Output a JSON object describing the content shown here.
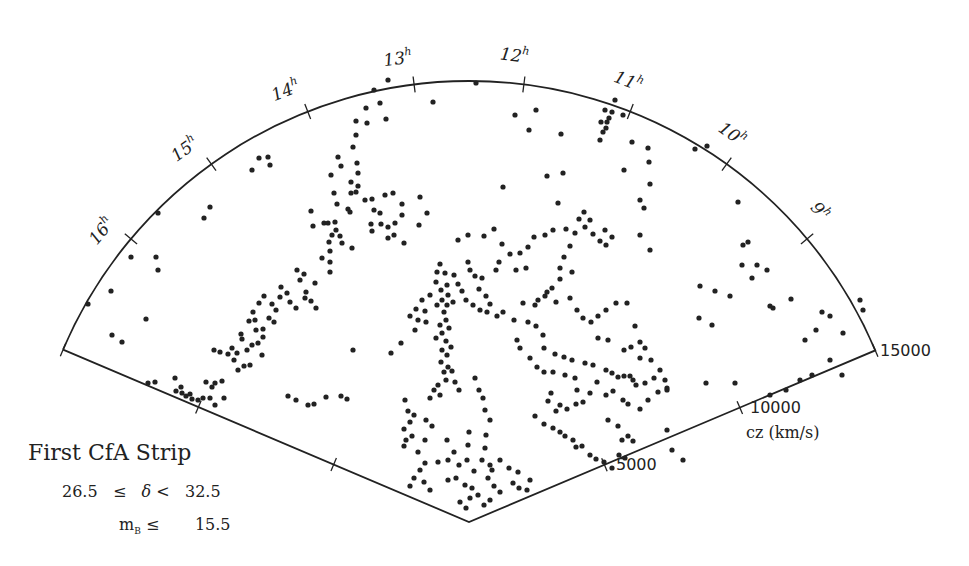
{
  "chart_data": {
    "type": "scatter",
    "projection": "polar-wedge",
    "title": "First CfA Strip",
    "subtitle_dec": "26.5  ≤  δ <  32.5",
    "subtitle_mag": "m_B ≤     15.5",
    "radial_axis": {
      "label": "cz (km/s)",
      "range": [
        0,
        15000
      ],
      "ticks": [
        5000,
        10000,
        15000
      ]
    },
    "angular_axis": {
      "label": "Right Ascension (h)",
      "range": [
        8.0,
        17.4
      ],
      "ticks": [
        "9h",
        "10h",
        "11h",
        "12h",
        "13h",
        "14h",
        "15h",
        "16h"
      ]
    },
    "points_pixel_note": "points given as [x, y] in 969x566 canvas pixels",
    "points": [
      [
        476,
        83
      ],
      [
        433,
        102
      ],
      [
        388,
        80
      ],
      [
        374,
        90
      ],
      [
        366,
        108
      ],
      [
        367,
        123
      ],
      [
        356,
        121
      ],
      [
        356,
        135
      ],
      [
        353,
        147
      ],
      [
        386,
        119
      ],
      [
        380,
        103
      ],
      [
        259,
        158
      ],
      [
        268,
        157
      ],
      [
        252,
        170
      ],
      [
        270,
        165
      ],
      [
        210,
        207
      ],
      [
        204,
        218
      ],
      [
        158,
        213
      ],
      [
        131,
        257
      ],
      [
        156,
        257
      ],
      [
        158,
        270
      ],
      [
        111,
        291
      ],
      [
        146,
        319
      ],
      [
        122,
        342
      ],
      [
        112,
        335
      ],
      [
        88,
        304
      ],
      [
        338,
        157
      ],
      [
        341,
        166
      ],
      [
        357,
        163
      ],
      [
        358,
        173
      ],
      [
        331,
        175
      ],
      [
        351,
        182
      ],
      [
        358,
        186
      ],
      [
        356,
        192
      ],
      [
        351,
        193
      ],
      [
        334,
        193
      ],
      [
        337,
        204
      ],
      [
        348,
        209
      ],
      [
        350,
        212
      ],
      [
        365,
        200
      ],
      [
        372,
        199
      ],
      [
        374,
        210
      ],
      [
        380,
        213
      ],
      [
        385,
        195
      ],
      [
        393,
        193
      ],
      [
        402,
        204
      ],
      [
        402,
        215
      ],
      [
        371,
        224
      ],
      [
        381,
        224
      ],
      [
        372,
        231
      ],
      [
        388,
        227
      ],
      [
        395,
        223
      ],
      [
        394,
        235
      ],
      [
        388,
        238
      ],
      [
        404,
        243
      ],
      [
        419,
        225
      ],
      [
        427,
        213
      ],
      [
        420,
        197
      ],
      [
        311,
        211
      ],
      [
        313,
        226
      ],
      [
        324,
        223
      ],
      [
        328,
        223
      ],
      [
        335,
        222
      ],
      [
        336,
        230
      ],
      [
        340,
        236
      ],
      [
        332,
        235
      ],
      [
        329,
        242
      ],
      [
        330,
        251
      ],
      [
        330,
        262
      ],
      [
        330,
        272
      ],
      [
        342,
        243
      ],
      [
        352,
        248
      ],
      [
        322,
        258
      ],
      [
        315,
        283
      ],
      [
        306,
        292
      ],
      [
        305,
        298
      ],
      [
        287,
        293
      ],
      [
        290,
        302
      ],
      [
        296,
        308
      ],
      [
        311,
        301
      ],
      [
        316,
        308
      ],
      [
        297,
        270
      ],
      [
        304,
        274
      ],
      [
        300,
        280
      ],
      [
        281,
        287
      ],
      [
        280,
        297
      ],
      [
        264,
        296
      ],
      [
        259,
        303
      ],
      [
        253,
        312
      ],
      [
        249,
        321
      ],
      [
        255,
        320
      ],
      [
        256,
        330
      ],
      [
        263,
        329
      ],
      [
        263,
        337
      ],
      [
        258,
        343
      ],
      [
        252,
        345
      ],
      [
        241,
        334
      ],
      [
        242,
        339
      ],
      [
        232,
        348
      ],
      [
        220,
        352
      ],
      [
        214,
        350
      ],
      [
        228,
        354
      ],
      [
        237,
        353
      ],
      [
        234,
        360
      ],
      [
        247,
        350
      ],
      [
        272,
        304
      ],
      [
        276,
        310
      ],
      [
        269,
        318
      ],
      [
        274,
        322
      ],
      [
        262,
        355
      ],
      [
        250,
        365
      ],
      [
        238,
        370
      ],
      [
        206,
        382
      ],
      [
        215,
        383
      ],
      [
        222,
        381
      ],
      [
        244,
        366
      ],
      [
        148,
        383
      ],
      [
        155,
        382
      ],
      [
        175,
        378
      ],
      [
        181,
        387
      ],
      [
        176,
        391
      ],
      [
        182,
        393
      ],
      [
        186,
        396
      ],
      [
        190,
        394
      ],
      [
        192,
        399
      ],
      [
        198,
        400
      ],
      [
        203,
        398
      ],
      [
        210,
        398
      ],
      [
        215,
        405
      ],
      [
        224,
        398
      ],
      [
        212,
        387
      ],
      [
        288,
        396
      ],
      [
        296,
        400
      ],
      [
        308,
        405
      ],
      [
        314,
        404
      ],
      [
        326,
        397
      ],
      [
        341,
        396
      ],
      [
        347,
        399
      ],
      [
        353,
        350
      ],
      [
        401,
        343
      ],
      [
        391,
        353
      ],
      [
        440,
        264
      ],
      [
        445,
        273
      ],
      [
        447,
        285
      ],
      [
        441,
        290
      ],
      [
        448,
        295
      ],
      [
        442,
        300
      ],
      [
        437,
        305
      ],
      [
        447,
        305
      ],
      [
        453,
        302
      ],
      [
        444,
        312
      ],
      [
        446,
        320
      ],
      [
        440,
        325
      ],
      [
        449,
        328
      ],
      [
        442,
        333
      ],
      [
        436,
        338
      ],
      [
        446,
        341
      ],
      [
        451,
        347
      ],
      [
        442,
        350
      ],
      [
        447,
        355
      ],
      [
        441,
        362
      ],
      [
        448,
        367
      ],
      [
        444,
        372
      ],
      [
        452,
        371
      ],
      [
        446,
        380
      ],
      [
        438,
        385
      ],
      [
        434,
        390
      ],
      [
        430,
        398
      ],
      [
        440,
        395
      ],
      [
        455,
        382
      ],
      [
        459,
        390
      ],
      [
        437,
        272
      ],
      [
        436,
        282
      ],
      [
        430,
        295
      ],
      [
        422,
        300
      ],
      [
        416,
        309
      ],
      [
        410,
        316
      ],
      [
        418,
        320
      ],
      [
        426,
        322
      ],
      [
        415,
        330
      ],
      [
        425,
        311
      ],
      [
        454,
        275
      ],
      [
        458,
        284
      ],
      [
        462,
        291
      ],
      [
        466,
        300
      ],
      [
        473,
        305
      ],
      [
        480,
        310
      ],
      [
        487,
        312
      ],
      [
        497,
        316
      ],
      [
        503,
        312
      ],
      [
        490,
        304
      ],
      [
        486,
        296
      ],
      [
        479,
        289
      ],
      [
        482,
        278
      ],
      [
        475,
        276
      ],
      [
        470,
        270
      ],
      [
        468,
        262
      ],
      [
        458,
        240
      ],
      [
        468,
        235
      ],
      [
        484,
        236
      ],
      [
        494,
        229
      ],
      [
        502,
        244
      ],
      [
        510,
        254
      ],
      [
        499,
        262
      ],
      [
        496,
        270
      ],
      [
        516,
        270
      ],
      [
        526,
        268
      ],
      [
        520,
        253
      ],
      [
        528,
        247
      ],
      [
        534,
        237
      ],
      [
        545,
        235
      ],
      [
        553,
        230
      ],
      [
        566,
        229
      ],
      [
        575,
        233
      ],
      [
        585,
        227
      ],
      [
        579,
        219
      ],
      [
        584,
        212
      ],
      [
        590,
        220
      ],
      [
        593,
        234
      ],
      [
        600,
        241
      ],
      [
        606,
        245
      ],
      [
        612,
        237
      ],
      [
        605,
        230
      ],
      [
        570,
        246
      ],
      [
        564,
        257
      ],
      [
        560,
        268
      ],
      [
        572,
        272
      ],
      [
        560,
        279
      ],
      [
        552,
        288
      ],
      [
        545,
        296
      ],
      [
        535,
        305
      ],
      [
        523,
        303
      ],
      [
        514,
        320
      ],
      [
        528,
        322
      ],
      [
        536,
        326
      ],
      [
        543,
        335
      ],
      [
        544,
        348
      ],
      [
        555,
        354
      ],
      [
        564,
        357
      ],
      [
        572,
        360
      ],
      [
        585,
        363
      ],
      [
        593,
        365
      ],
      [
        606,
        370
      ],
      [
        612,
        373
      ],
      [
        618,
        377
      ],
      [
        624,
        376
      ],
      [
        633,
        380
      ],
      [
        645,
        383
      ],
      [
        654,
        378
      ],
      [
        667,
        388
      ],
      [
        517,
        340
      ],
      [
        520,
        348
      ],
      [
        530,
        358
      ],
      [
        537,
        367
      ],
      [
        544,
        372
      ],
      [
        553,
        372
      ],
      [
        565,
        375
      ],
      [
        575,
        378
      ],
      [
        577,
        390
      ],
      [
        551,
        393
      ],
      [
        548,
        401
      ],
      [
        556,
        411
      ],
      [
        560,
        405
      ],
      [
        567,
        409
      ],
      [
        576,
        404
      ],
      [
        583,
        402
      ],
      [
        590,
        393
      ],
      [
        597,
        382
      ],
      [
        635,
        326
      ],
      [
        640,
        342
      ],
      [
        645,
        348
      ],
      [
        651,
        360
      ],
      [
        660,
        370
      ],
      [
        665,
        380
      ],
      [
        667,
        390
      ],
      [
        658,
        392
      ],
      [
        648,
        400
      ],
      [
        640,
        409
      ],
      [
        636,
        385
      ],
      [
        630,
        376
      ],
      [
        623,
        400
      ],
      [
        628,
        404
      ],
      [
        613,
        391
      ],
      [
        606,
        395
      ],
      [
        640,
        358
      ],
      [
        631,
        347
      ],
      [
        624,
        350
      ],
      [
        608,
        340
      ],
      [
        598,
        338
      ],
      [
        405,
        400
      ],
      [
        408,
        411
      ],
      [
        414,
        415
      ],
      [
        410,
        422
      ],
      [
        404,
        429
      ],
      [
        412,
        436
      ],
      [
        406,
        440
      ],
      [
        404,
        446
      ],
      [
        418,
        452
      ],
      [
        425,
        440
      ],
      [
        432,
        426
      ],
      [
        426,
        420
      ],
      [
        475,
        378
      ],
      [
        479,
        390
      ],
      [
        483,
        398
      ],
      [
        485,
        410
      ],
      [
        490,
        420
      ],
      [
        486,
        435
      ],
      [
        485,
        448
      ],
      [
        482,
        460
      ],
      [
        490,
        465
      ],
      [
        492,
        470
      ],
      [
        488,
        478
      ],
      [
        494,
        486
      ],
      [
        500,
        492
      ],
      [
        490,
        500
      ],
      [
        484,
        505
      ],
      [
        478,
        495
      ],
      [
        472,
        488
      ],
      [
        470,
        498
      ],
      [
        466,
        508
      ],
      [
        460,
        502
      ],
      [
        465,
        485
      ],
      [
        474,
        471
      ],
      [
        467,
        460
      ],
      [
        459,
        465
      ],
      [
        454,
        452
      ],
      [
        448,
        460
      ],
      [
        438,
        462
      ],
      [
        425,
        463
      ],
      [
        420,
        470
      ],
      [
        414,
        478
      ],
      [
        424,
        482
      ],
      [
        430,
        490
      ],
      [
        410,
        486
      ],
      [
        448,
        480
      ],
      [
        456,
        478
      ],
      [
        468,
        445
      ],
      [
        469,
        432
      ],
      [
        447,
        440
      ],
      [
        500,
        460
      ],
      [
        509,
        468
      ],
      [
        518,
        472
      ],
      [
        527,
        490
      ],
      [
        519,
        488
      ],
      [
        513,
        483
      ],
      [
        530,
        480
      ],
      [
        535,
        416
      ],
      [
        544,
        424
      ],
      [
        553,
        428
      ],
      [
        560,
        432
      ],
      [
        565,
        436
      ],
      [
        573,
        440
      ],
      [
        576,
        447
      ],
      [
        582,
        446
      ],
      [
        590,
        455
      ],
      [
        596,
        459
      ],
      [
        604,
        462
      ],
      [
        612,
        468
      ],
      [
        619,
        455
      ],
      [
        622,
        440
      ],
      [
        628,
        436
      ],
      [
        633,
        441
      ],
      [
        625,
        458
      ],
      [
        618,
        426
      ],
      [
        608,
        420
      ],
      [
        615,
        100
      ],
      [
        612,
        112
      ],
      [
        609,
        118
      ],
      [
        607,
        122
      ],
      [
        606,
        128
      ],
      [
        603,
        132
      ],
      [
        600,
        140
      ],
      [
        623,
        115
      ],
      [
        632,
        142
      ],
      [
        648,
        148
      ],
      [
        649,
        162
      ],
      [
        650,
        184
      ],
      [
        644,
        208
      ],
      [
        640,
        235
      ],
      [
        650,
        250
      ],
      [
        624,
        170
      ],
      [
        640,
        200
      ],
      [
        601,
        122
      ],
      [
        605,
        110
      ],
      [
        536,
        110
      ],
      [
        529,
        130
      ],
      [
        561,
        134
      ],
      [
        547,
        176
      ],
      [
        563,
        173
      ],
      [
        558,
        203
      ],
      [
        503,
        187
      ],
      [
        515,
        115
      ],
      [
        695,
        149
      ],
      [
        707,
        146
      ],
      [
        738,
        202
      ],
      [
        743,
        245
      ],
      [
        748,
        242
      ],
      [
        742,
        265
      ],
      [
        752,
        278
      ],
      [
        757,
        265
      ],
      [
        767,
        270
      ],
      [
        791,
        299
      ],
      [
        770,
        306
      ],
      [
        773,
        308
      ],
      [
        700,
        286
      ],
      [
        715,
        291
      ],
      [
        730,
        296
      ],
      [
        712,
        325
      ],
      [
        699,
        318
      ],
      [
        805,
        340
      ],
      [
        816,
        330
      ],
      [
        822,
        312
      ],
      [
        830,
        316
      ],
      [
        843,
        333
      ],
      [
        860,
        300
      ],
      [
        863,
        310
      ],
      [
        842,
        375
      ],
      [
        830,
        360
      ],
      [
        800,
        380
      ],
      [
        812,
        375
      ],
      [
        786,
        390
      ],
      [
        770,
        395
      ],
      [
        706,
        383
      ],
      [
        735,
        383
      ],
      [
        683,
        460
      ],
      [
        672,
        450
      ],
      [
        667,
        430
      ],
      [
        538,
        300
      ],
      [
        547,
        292
      ],
      [
        556,
        302
      ],
      [
        570,
        298
      ],
      [
        577,
        310
      ],
      [
        583,
        318
      ],
      [
        591,
        322
      ],
      [
        598,
        316
      ],
      [
        606,
        310
      ],
      [
        616,
        303
      ],
      [
        627,
        303
      ]
    ]
  },
  "labels": {
    "title": "First CfA Strip",
    "dec_low": "26.5",
    "dec_le": "≤",
    "dec_sym": "δ",
    "dec_lt": "<",
    "dec_high": "32.5",
    "mag_sym": "m",
    "mag_sub": "B",
    "mag_le": "≤",
    "mag_val": "15.5",
    "cz_axis": "cz (km/s)",
    "cz_ticks": [
      "5000",
      "10000",
      "15000"
    ],
    "ra_ticks": [
      "9",
      "10",
      "11",
      "12",
      "13",
      "14",
      "15",
      "16"
    ],
    "ra_unit": "h"
  },
  "colors": {
    "ink": "#222222",
    "background": "#ffffff"
  }
}
